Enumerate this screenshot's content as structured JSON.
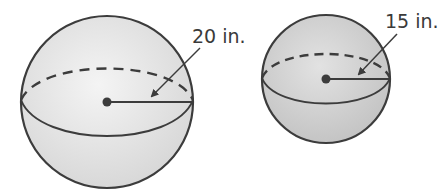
{
  "figure": {
    "spheres": [
      {
        "id": "large",
        "radius_label": "20 in.",
        "center": [
          107,
          102
        ],
        "r": 86,
        "fill": "#e4e4e4",
        "stroke": "#3c3c3c"
      },
      {
        "id": "small",
        "radius_label": "15 in.",
        "center": [
          326,
          79
        ],
        "r": 64,
        "fill": "#d4d4d4",
        "stroke": "#3c3c3c"
      }
    ]
  }
}
